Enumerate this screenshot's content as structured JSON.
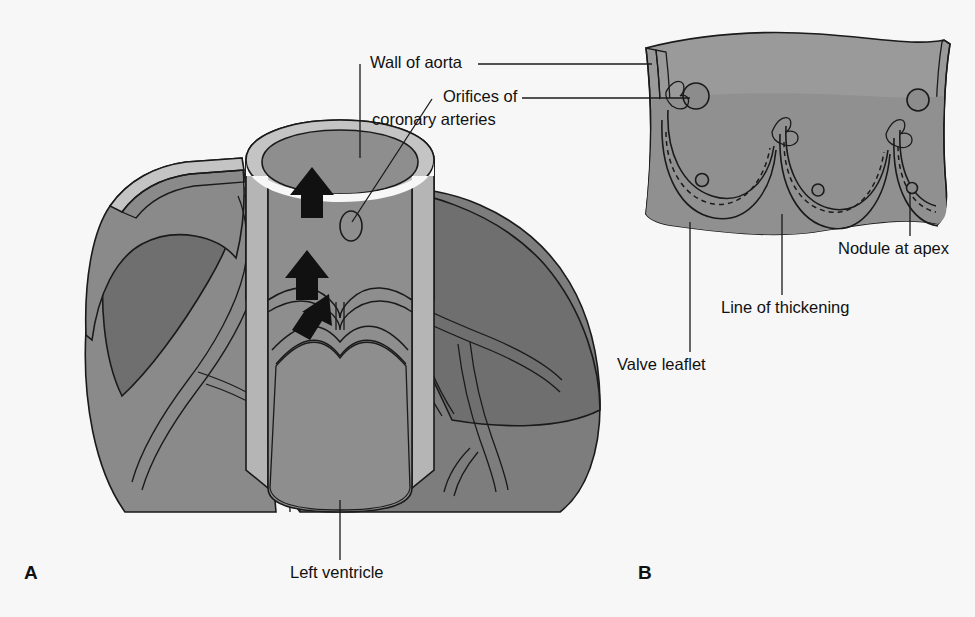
{
  "figure": {
    "background_color": "#f7f7f7",
    "line_color": "#1a1a1a",
    "text_color": "#111111"
  },
  "palette": {
    "wall_mid": "#9a9a9a",
    "wall_dark": "#7d7d7d",
    "wall_darker": "#6f6f6f",
    "lumen": "#8e8e8e",
    "rim_light": "#b5b5b5",
    "rim_lighter": "#c4c4c4",
    "nodule": "#8a8a8a",
    "arrow": "#111111"
  },
  "panels": [
    {
      "id": "A",
      "letter": "A",
      "name": "cut-away-aortic-root",
      "description": "Cut-away view of aortic root and left ventricle with coronary arteries"
    },
    {
      "id": "B",
      "letter": "B",
      "name": "opened-aorta-valve",
      "description": "Aorta opened out to show three semilunar valve leaflets"
    }
  ],
  "labels": [
    {
      "id": "wall-of-aorta",
      "text": "Wall of aorta",
      "x": 370,
      "y": 64,
      "anchor": "start"
    },
    {
      "id": "orifices-line1",
      "text": "Orifices of",
      "x": 443,
      "y": 98,
      "anchor": "start"
    },
    {
      "id": "orifices-line2",
      "text": "coronary arteries",
      "x": 372,
      "y": 121,
      "anchor": "start"
    },
    {
      "id": "nodule-at-apex",
      "text": "Nodule at apex",
      "x": 838,
      "y": 250,
      "anchor": "start"
    },
    {
      "id": "line-of-thickening",
      "text": "Line of thickening",
      "x": 721,
      "y": 309,
      "anchor": "start"
    },
    {
      "id": "valve-leaflet",
      "text": "Valve leaflet",
      "x": 617,
      "y": 366,
      "anchor": "start"
    },
    {
      "id": "left-ventricle",
      "text": "Left ventricle",
      "x": 290,
      "y": 574,
      "anchor": "start"
    }
  ],
  "panel_letters": [
    {
      "id": "letter-a",
      "text": "A",
      "x": 24,
      "y": 574
    },
    {
      "id": "letter-b",
      "text": "B",
      "x": 638,
      "y": 574
    }
  ],
  "panel_a": {
    "flow_arrows": [
      {
        "id": "arrow-upper",
        "direction": "up"
      },
      {
        "id": "arrow-middle",
        "direction": "up-right"
      },
      {
        "id": "arrow-lower",
        "direction": "up"
      }
    ],
    "coronary_orifice": {
      "id": "coronary-orifice-ellipse"
    }
  },
  "panel_b": {
    "leaflet_count": 3,
    "coronary_orifices": 3,
    "nodules": 3
  }
}
